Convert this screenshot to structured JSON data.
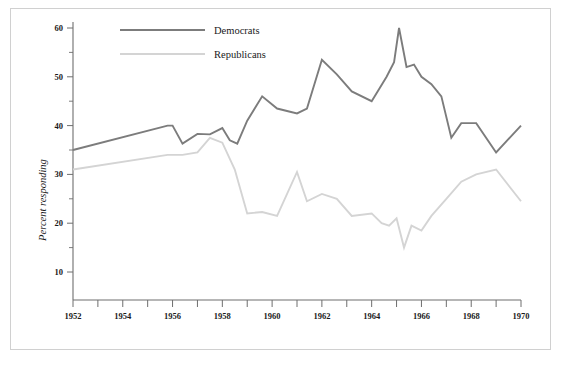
{
  "chart_data": {
    "type": "line",
    "title": "",
    "xlabel": "",
    "ylabel": "Percent responding",
    "xlim": [
      1952,
      1970
    ],
    "ylim": [
      0,
      62
    ],
    "yticks": [
      10,
      20,
      30,
      40,
      50,
      60
    ],
    "ytick_labels": [
      "10",
      "20",
      "30",
      "40",
      "50",
      "60"
    ],
    "xticks": [
      1952,
      1953,
      1954,
      1955,
      1956,
      1957,
      1958,
      1959,
      1960,
      1961,
      1962,
      1963,
      1964,
      1965,
      1966,
      1967,
      1968,
      1969,
      1970
    ],
    "xtick_labels": [
      "1952",
      "",
      "1954",
      "",
      "1956",
      "",
      "1958",
      "",
      "1960",
      "",
      "1962",
      "",
      "1964",
      "",
      "1966",
      "",
      "1968",
      "",
      "1970"
    ],
    "grid": false,
    "legend_position": "top-left",
    "series": [
      {
        "name": "Democrats",
        "color": "#7c7c7c",
        "x": [
          1952,
          1955.8,
          1956.0,
          1956.4,
          1957.0,
          1957.5,
          1958.0,
          1958.3,
          1958.6,
          1959.0,
          1959.6,
          1960.2,
          1961.0,
          1961.4,
          1962.0,
          1962.6,
          1963.2,
          1964.0,
          1964.6,
          1964.9,
          1965.1,
          1965.4,
          1965.7,
          1966.0,
          1966.4,
          1966.8,
          1967.2,
          1967.6,
          1968.2,
          1969.0,
          1970.0
        ],
        "y": [
          35.0,
          40.0,
          40.0,
          36.3,
          38.3,
          38.2,
          39.5,
          37.0,
          36.3,
          41.0,
          46.0,
          43.5,
          42.5,
          43.5,
          53.5,
          50.5,
          47.0,
          45.0,
          50.0,
          53.0,
          60.0,
          52.0,
          52.5,
          50.0,
          48.5,
          46.0,
          37.5,
          40.5,
          40.5,
          34.5,
          40.0
        ]
      },
      {
        "name": "Republicans",
        "color": "#d4d4d4",
        "x": [
          1952,
          1955.8,
          1956.0,
          1956.4,
          1957.0,
          1957.5,
          1958.0,
          1958.5,
          1959.0,
          1959.6,
          1960.2,
          1961.0,
          1961.4,
          1962.0,
          1962.6,
          1963.2,
          1964.0,
          1964.4,
          1964.7,
          1965.0,
          1965.3,
          1965.6,
          1966.0,
          1966.4,
          1967.0,
          1967.6,
          1968.2,
          1969.0,
          1970.0
        ],
        "y": [
          31.0,
          34.0,
          34.0,
          34.0,
          34.5,
          37.5,
          36.5,
          31.0,
          22.0,
          22.3,
          21.5,
          30.5,
          24.5,
          26.0,
          25.0,
          21.5,
          22.0,
          20.0,
          19.5,
          21.0,
          15.0,
          19.5,
          18.5,
          21.5,
          25.0,
          28.5,
          30.0,
          31.0,
          24.5
        ]
      }
    ],
    "annotations": []
  },
  "legend": {
    "items": [
      {
        "label": "Democrats",
        "color": "#7c7c7c"
      },
      {
        "label": "Republicans",
        "color": "#d4d4d4"
      }
    ]
  },
  "axes": {
    "y_title": "Percent responding"
  }
}
